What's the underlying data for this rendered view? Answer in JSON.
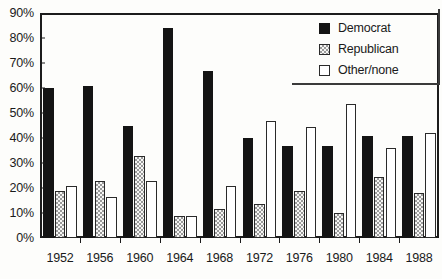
{
  "chart_data": {
    "type": "bar",
    "title": "",
    "xlabel": "",
    "ylabel": "",
    "ylim": [
      0,
      90
    ],
    "grid": false,
    "legend_position": "top-right",
    "categories": [
      "1952",
      "1956",
      "1960",
      "1964",
      "1968",
      "1972",
      "1976",
      "1980",
      "1984",
      "1988"
    ],
    "ytick_labels": [
      "0%",
      "10%",
      "20%",
      "30%",
      "40%",
      "50%",
      "60%",
      "70%",
      "80%",
      "90%"
    ],
    "ytick_values": [
      0,
      10,
      20,
      30,
      40,
      50,
      60,
      70,
      80,
      90
    ],
    "series": [
      {
        "name": "Democrat",
        "swatch": "dem",
        "values": [
          60,
          61,
          45,
          84,
          67,
          40,
          37,
          37,
          41,
          41
        ]
      },
      {
        "name": "Republican",
        "swatch": "rep",
        "values": [
          19,
          23,
          33,
          9,
          11.5,
          13.5,
          19,
          10,
          24.5,
          18
        ]
      },
      {
        "name": "Other/none",
        "swatch": "oth",
        "values": [
          21,
          16.5,
          23,
          9,
          21,
          47,
          44.5,
          53.5,
          36,
          42
        ]
      }
    ]
  },
  "legend": {
    "items": [
      {
        "label": "Democrat",
        "swatch": "dem"
      },
      {
        "label": "Republican",
        "swatch": "rep"
      },
      {
        "label": "Other/none",
        "swatch": "oth"
      }
    ]
  },
  "colors": {
    "democrat": "#141414",
    "republican": "#9a9a9a",
    "other": "#ffffff",
    "axis": "#1c1c1c",
    "background": "#fdfdfb"
  }
}
